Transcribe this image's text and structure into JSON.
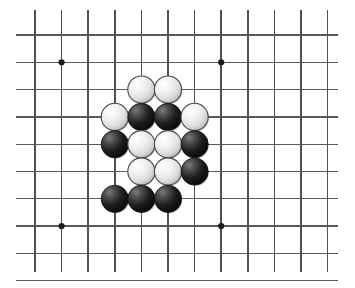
{
  "board": {
    "title": "Go board position",
    "width": 355,
    "height": 288,
    "background_color": "#ffffff",
    "line_color": "#555a5e",
    "cols": 12,
    "rows": 10,
    "col_x": [
      35,
      61.6,
      88.2,
      114.8,
      141.4,
      168,
      194.6,
      221.2,
      247.8,
      274.4,
      301,
      327.6
    ],
    "row_y": [
      35,
      62.3,
      89.6,
      116.9,
      144.2,
      171.5,
      198.8,
      226.1,
      253.4,
      280.7
    ],
    "line_extent": {
      "h_start_x": 16,
      "h_end_x": 338,
      "v_start_y": 10,
      "v_end_y": 272
    },
    "hoshi_radius": 3.1,
    "hoshi_points": [
      {
        "col": 1,
        "row": 1
      },
      {
        "col": 7,
        "row": 1
      },
      {
        "col": 1,
        "row": 7
      },
      {
        "col": 7,
        "row": 7
      }
    ],
    "stone_radius": 13.6,
    "stone_colors": {
      "white_fill_light": "#fdfdfd",
      "white_fill_mid": "#e2e2e2",
      "white_fill_dark": "#b9b9b9",
      "white_outline": "#4a4a4a",
      "black_fill_light": "#6e6e6e",
      "black_fill_mid": "#272727",
      "black_fill_dark": "#050505",
      "black_outline": "#101010"
    },
    "stones": [
      {
        "id": "w-e3",
        "color": "white",
        "col": 4,
        "row": 2
      },
      {
        "id": "w-f3",
        "color": "white",
        "col": 5,
        "row": 2
      },
      {
        "id": "w-d4",
        "color": "white",
        "col": 3,
        "row": 3
      },
      {
        "id": "b-e4",
        "color": "black",
        "col": 4,
        "row": 3
      },
      {
        "id": "b-f4",
        "color": "black",
        "col": 5,
        "row": 3
      },
      {
        "id": "w-g4",
        "color": "white",
        "col": 6,
        "row": 3
      },
      {
        "id": "b-d5",
        "color": "black",
        "col": 3,
        "row": 4
      },
      {
        "id": "w-e5",
        "color": "white",
        "col": 4,
        "row": 4
      },
      {
        "id": "w-f5",
        "color": "white",
        "col": 5,
        "row": 4
      },
      {
        "id": "b-g5",
        "color": "black",
        "col": 6,
        "row": 4
      },
      {
        "id": "w-e6",
        "color": "white",
        "col": 4,
        "row": 5
      },
      {
        "id": "w-f6",
        "color": "white",
        "col": 5,
        "row": 5
      },
      {
        "id": "b-g6",
        "color": "black",
        "col": 6,
        "row": 5
      },
      {
        "id": "b-d7",
        "color": "black",
        "col": 3,
        "row": 6
      },
      {
        "id": "b-e7",
        "color": "black",
        "col": 4,
        "row": 6
      },
      {
        "id": "b-f7",
        "color": "black",
        "col": 5,
        "row": 6
      }
    ],
    "stone_counts": {
      "white": 8,
      "black": 8,
      "total": 16
    }
  }
}
